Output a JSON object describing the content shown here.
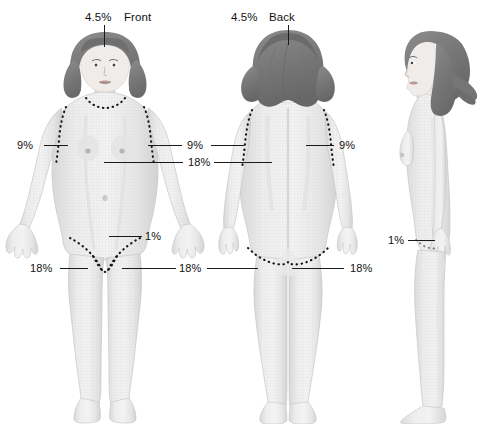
{
  "diagram": {
    "views": [
      {
        "id": "front",
        "view_label": "Front",
        "head_percent": "4.5%"
      },
      {
        "id": "back",
        "view_label": "Back",
        "head_percent": "4.5%"
      },
      {
        "id": "side",
        "view_label": "",
        "head_percent": ""
      }
    ],
    "labels": {
      "head_front_percent": "4.5%",
      "head_front_view": "Front",
      "head_back_percent": "4.5%",
      "head_back_view": "Back",
      "arm_front_left_percent": "9%",
      "arm_shared_middle_percent": "9%",
      "arm_back_right_percent": "9%",
      "trunk_percent": "18%",
      "genital_front_percent": "1%",
      "genital_side_percent": "1%",
      "leg_front_left_percent": "18%",
      "leg_shared_middle_percent": "18%",
      "leg_back_right_percent": "18%"
    },
    "colors": {
      "skin": "#ececec",
      "skin_shadow": "#d8d8d8",
      "skin_edge": "#c4c4c4",
      "hair": "#8a8a8a",
      "hair_dark": "#6e6e6e",
      "leader_line": "#1a1a1a",
      "text": "#111111",
      "dotted_demarcation": "#161616",
      "background": "#ffffff"
    }
  }
}
